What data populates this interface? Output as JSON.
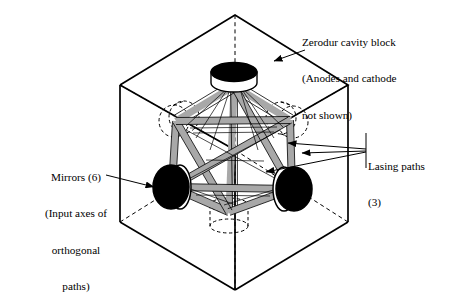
{
  "figure": {
    "type": "technical-line-diagram",
    "background_color": "#ffffff",
    "line_color": "#000000",
    "beam_fill_color": "#a8a8a8",
    "mirror_face_color": "#000000",
    "mirror_body_color": "#ffffff"
  },
  "labels": {
    "zerodur": {
      "name": "zerodur-cavity-block-label",
      "lines": [
        "Zerodur cavity block",
        "(Anodes and cathode",
        "not shown)"
      ],
      "align": "left"
    },
    "mirrors": {
      "name": "mirrors-label",
      "lines": [
        "Mirrors (6)",
        "(Input axes of",
        "orthogonal",
        "paths)"
      ],
      "align": "center"
    },
    "lasing": {
      "name": "lasing-paths-label",
      "lines": [
        "Lasing paths",
        "(3)"
      ],
      "align": "left"
    }
  },
  "geometry": {
    "cube": {
      "top_vertex": [
        235,
        15
      ],
      "left_vertex": [
        120,
        85
      ],
      "right_vertex": [
        348,
        85
      ],
      "center_vertex": [
        235,
        150
      ],
      "bottom_vertex": [
        235,
        290
      ],
      "left_bottom_vertex": [
        120,
        222
      ],
      "right_bottom_vertex": [
        348,
        222
      ],
      "hidden_back_vertex": [
        235,
        150
      ]
    },
    "mirrors_visible": [
      {
        "id": "mirror-top",
        "center": [
          234,
          72
        ],
        "orientation": "top-face"
      },
      {
        "id": "mirror-bottom-left",
        "center": [
          172,
          187
        ],
        "orientation": "left-face"
      },
      {
        "id": "mirror-bottom-right",
        "center": [
          292,
          189
        ],
        "orientation": "right-face"
      }
    ],
    "mirrors_hidden": [
      {
        "id": "mirror-hidden-upper-left",
        "center": [
          178,
          119
        ]
      },
      {
        "id": "mirror-hidden-upper-right",
        "center": [
          287,
          118
        ]
      },
      {
        "id": "mirror-hidden-bottom",
        "center": [
          229,
          216
        ]
      }
    ],
    "lasing_path_count": 3,
    "mirror_count": 6
  },
  "leaders": {
    "zerodur_arrow": {
      "from": [
        303,
        52
      ],
      "to": [
        272,
        62
      ]
    },
    "mirrors_arrow": {
      "from": [
        108,
        176
      ],
      "to": [
        155,
        187
      ]
    },
    "lasing_arrows": [
      {
        "from": [
          366,
          150
        ],
        "to": [
          286,
          144
        ]
      },
      {
        "from": [
          366,
          151
        ],
        "to": [
          300,
          153
        ]
      },
      {
        "from": [
          366,
          152
        ],
        "to": [
          264,
          172
        ]
      }
    ]
  }
}
